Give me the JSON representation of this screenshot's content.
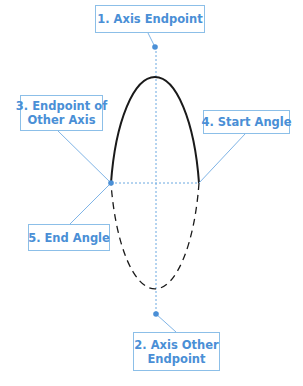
{
  "diagram": {
    "colors": {
      "ellipse_stroke": "#1a1a1a",
      "accent": "#4a8fd6",
      "box_border": "#8cbfe8",
      "leader": "#7fb4e6",
      "axis_dashed": "#6aa8e0"
    },
    "ellipse": {
      "cx": 156,
      "cy": 181,
      "rx": 45,
      "ry": 134,
      "solid_half": "top",
      "dashed_half": "bottom"
    },
    "labels": [
      {
        "id": "axis-endpoint",
        "number": "1",
        "lines": [
          "1. Axis Endpoint"
        ],
        "anchor": [
          155,
          47
        ]
      },
      {
        "id": "axis-other-endpoint",
        "number": "2",
        "lines": [
          "2. Axis Other",
          "Endpoint"
        ],
        "anchor": [
          156,
          314
        ]
      },
      {
        "id": "endpoint-other-axis",
        "number": "3",
        "lines": [
          "3. Endpoint of",
          "Other Axis"
        ],
        "anchor": [
          111,
          183
        ]
      },
      {
        "id": "start-angle",
        "number": "4",
        "lines": [
          "4. Start Angle"
        ],
        "anchor": [
          199,
          183
        ]
      },
      {
        "id": "end-angle",
        "number": "5",
        "lines": [
          "5. End Angle"
        ],
        "anchor": [
          111,
          183
        ]
      }
    ]
  }
}
